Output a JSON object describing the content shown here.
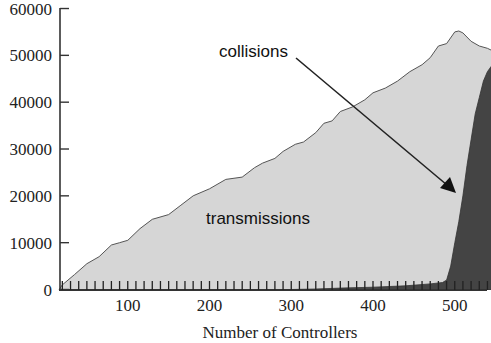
{
  "chart_data": {
    "type": "area",
    "title": "",
    "xlabel": "Number of Controllers",
    "ylabel": "",
    "xlim": [
      16,
      550
    ],
    "ylim": [
      0,
      60000
    ],
    "grid": false,
    "legend": "none (inline annotations)",
    "x_ticks": [
      100,
      200,
      300,
      400,
      500
    ],
    "y_ticks": [
      0,
      10000,
      20000,
      30000,
      40000,
      50000,
      60000
    ],
    "x_tick_labels": [
      "100",
      "200",
      "300",
      "400",
      "500"
    ],
    "y_tick_labels": [
      "0",
      "10000",
      "20000",
      "30000",
      "40000",
      "50000",
      "60000"
    ],
    "series": [
      {
        "name": "transmissions",
        "color": "#d6d6d6",
        "x": [
          16,
          20,
          35,
          50,
          65,
          80,
          90,
          100,
          115,
          130,
          150,
          165,
          180,
          200,
          220,
          240,
          255,
          265,
          280,
          290,
          305,
          315,
          330,
          340,
          350,
          360,
          375,
          390,
          400,
          415,
          430,
          445,
          460,
          470,
          480,
          490,
          500,
          505,
          510,
          520,
          530,
          540,
          546
        ],
        "values": [
          0,
          1000,
          3200,
          5500,
          7000,
          9500,
          10000,
          10500,
          13000,
          15000,
          16000,
          18000,
          20000,
          21500,
          23500,
          24000,
          26000,
          27000,
          28000,
          29500,
          31000,
          31500,
          33500,
          35500,
          36000,
          38000,
          39000,
          40500,
          42000,
          43000,
          44500,
          46500,
          48000,
          49500,
          52000,
          52500,
          55000,
          55200,
          54800,
          53000,
          52000,
          51500,
          51000
        ]
      },
      {
        "name": "collisions",
        "color": "#444444",
        "x": [
          16,
          300,
          330,
          360,
          400,
          440,
          470,
          485,
          490,
          495,
          500,
          505,
          510,
          515,
          520,
          525,
          530,
          535,
          540,
          546
        ],
        "values": [
          0,
          0,
          100,
          300,
          500,
          800,
          1200,
          1500,
          2000,
          5000,
          10000,
          14500,
          20000,
          26500,
          32000,
          37500,
          41000,
          44500,
          46500,
          48000
        ]
      }
    ],
    "annotations": [
      {
        "text": "collisions",
        "x": 375,
        "y": 50500,
        "arrow_to": [
          500,
          20500
        ]
      },
      {
        "text": "transmissions",
        "x": 240,
        "y": 15000
      }
    ]
  }
}
